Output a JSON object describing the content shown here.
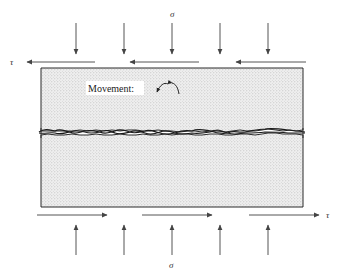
{
  "diagram": {
    "labels": {
      "normal_stress_top": "σ",
      "normal_stress_bottom": "σ",
      "shear_stress_top": "τ",
      "shear_stress_bottom": "τ",
      "movement": "Movement:"
    },
    "normal_arrows_top_x": [
      76,
      124,
      172,
      220,
      268
    ],
    "normal_arrows_bottom_x": [
      76,
      124,
      172,
      220,
      268
    ],
    "shear_arrows_top": [
      {
        "x1": 95,
        "x2": 26,
        "label": "left"
      },
      {
        "x1": 199,
        "x2": 129,
        "label": "left"
      },
      {
        "x1": 306,
        "x2": 235,
        "label": "left"
      }
    ],
    "shear_arrows_bottom": [
      {
        "x1": 37,
        "x2": 108,
        "label": "right"
      },
      {
        "x1": 142,
        "x2": 213,
        "label": "right"
      },
      {
        "x1": 249,
        "x2": 320,
        "label": "right"
      }
    ],
    "block": {
      "left": 41,
      "right": 303,
      "top": 68,
      "bottom": 207,
      "joint_y": 133
    },
    "colors": {
      "ink": "#2a2a2a",
      "arrow": "#555555",
      "stipple_bg": "#efefef",
      "stipple_dot": "#b8b8b8"
    }
  }
}
